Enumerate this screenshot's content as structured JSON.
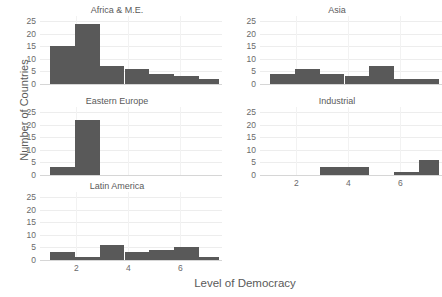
{
  "figure": {
    "xlabel": "Level of Democracy",
    "ylabel": "Number of Countries",
    "bar_color": "#595959",
    "grid_color": "#ededed",
    "background": "#ffffff"
  },
  "axis": {
    "yticks": [
      "0",
      "5",
      "10",
      "15",
      "20",
      "25"
    ],
    "xticks": [
      "2",
      "4",
      "6"
    ],
    "ylim": [
      0,
      27
    ],
    "xlim": [
      0.6,
      7.6
    ]
  },
  "panels": [
    {
      "title": "Africa & M.E.",
      "row": 0,
      "col": 0,
      "show_xticks": false,
      "bins": [
        1,
        1.95,
        2.9,
        3.85,
        4.8,
        5.75,
        6.7,
        7.5
      ],
      "values": [
        15,
        24,
        7,
        6,
        4,
        3,
        2
      ]
    },
    {
      "title": "Asia",
      "row": 0,
      "col": 1,
      "show_xticks": false,
      "bins": [
        1,
        1.95,
        2.9,
        3.85,
        4.8,
        5.75,
        6.7,
        7.5
      ],
      "values": [
        4,
        6,
        4,
        3,
        7,
        2,
        2
      ]
    },
    {
      "title": "Eastern Europe",
      "row": 1,
      "col": 0,
      "show_xticks": false,
      "bins": [
        1,
        1.95,
        2.9
      ],
      "values": [
        3,
        22
      ]
    },
    {
      "title": "Industrial",
      "row": 1,
      "col": 1,
      "show_xticks": true,
      "bins": [
        1.95,
        2.9,
        4.8,
        5.75,
        6.7,
        7.5
      ],
      "values": [
        0,
        3,
        0,
        1,
        6,
        14
      ]
    },
    {
      "title": "Latin America",
      "row": 2,
      "col": 0,
      "show_xticks": true,
      "bins": [
        1,
        1.95,
        2.9,
        3.85,
        4.8,
        5.75,
        6.7,
        7.5
      ],
      "values": [
        3,
        1,
        6,
        3,
        4,
        5,
        1
      ]
    }
  ],
  "chart_data": {
    "type": "bar",
    "title": "",
    "subtitle": "",
    "xlabel": "Level of Democracy",
    "ylabel": "Number of Countries",
    "ylim": [
      0,
      27
    ],
    "xlim": [
      0.6,
      7.6
    ],
    "yticks": [
      0,
      5,
      10,
      15,
      20,
      25
    ],
    "xticks": [
      2,
      4,
      6
    ],
    "grid": true,
    "legend": "none",
    "layout": "small-multiples 3 rows x 2 cols (bottom-right panel empty)",
    "bin_edges": [
      1,
      1.95,
      2.9,
      3.85,
      4.8,
      5.75,
      6.7,
      7.5
    ],
    "bin_centers": [
      1.5,
      2.4,
      3.4,
      4.3,
      5.3,
      6.2,
      7.1
    ],
    "panels": [
      {
        "name": "Africa & M.E.",
        "categories": [
          "1-2",
          "2-3",
          "3-4",
          "4-5",
          "5-6",
          "6-7",
          "7-7.5"
        ],
        "values": [
          15,
          24,
          7,
          6,
          4,
          3,
          2
        ],
        "total": 61
      },
      {
        "name": "Asia",
        "categories": [
          "1-2",
          "2-3",
          "3-4",
          "4-5",
          "5-6",
          "6-7",
          "7-7.5"
        ],
        "values": [
          4,
          6,
          4,
          3,
          7,
          2,
          2
        ],
        "total": 28
      },
      {
        "name": "Eastern Europe",
        "categories": [
          "1-2",
          "2-3",
          "3-4",
          "4-5",
          "5-6",
          "6-7",
          "7-7.5"
        ],
        "values": [
          3,
          22,
          0,
          0,
          0,
          0,
          0
        ],
        "total": 25
      },
      {
        "name": "Industrial",
        "categories": [
          "1-2",
          "2-3",
          "3-4",
          "4-5",
          "5-6",
          "6-7",
          "7-7.5"
        ],
        "values": [
          0,
          3,
          0,
          0,
          1,
          6,
          14
        ],
        "total": 24
      },
      {
        "name": "Latin America",
        "categories": [
          "1-2",
          "2-3",
          "3-4",
          "4-5",
          "5-6",
          "6-7",
          "7-7.5"
        ],
        "values": [
          3,
          1,
          6,
          3,
          4,
          5,
          1
        ],
        "total": 23
      }
    ]
  }
}
